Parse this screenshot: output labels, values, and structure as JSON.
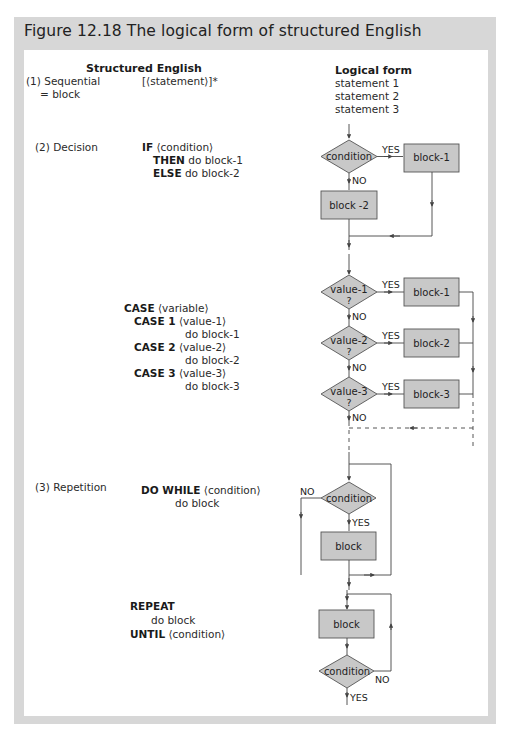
{
  "figure": {
    "title": "Figure 12.18 The logical form of structured English"
  },
  "headers": {
    "structured_english": "Structured English",
    "logical_form": "Logical form"
  },
  "sequential": {
    "label_line1": "(1) Sequential",
    "label_line2": "= block",
    "syntax": "[⟨statement⟩]*",
    "logical_form": [
      "statement 1",
      "statement 2",
      "statement 3"
    ]
  },
  "decision": {
    "label": "(2) Decision",
    "if_keyword": "IF",
    "if_rest": "⟨condition⟩",
    "then_keyword": "THEN",
    "then_rest": "do block-1",
    "else_keyword": "ELSE",
    "else_rest": "do block-2",
    "flow": {
      "diamond": "condition",
      "yes": "YES",
      "no": "NO",
      "block_yes": "block-1",
      "block_no": "block -2"
    }
  },
  "case": {
    "case_keyword": "CASE",
    "case_rest": "⟨variable⟩",
    "items": [
      {
        "keyword": "CASE 1",
        "value": "⟨value-1⟩",
        "action": "do block-1"
      },
      {
        "keyword": "CASE 2",
        "value": "⟨value-2⟩",
        "action": "do block-2"
      },
      {
        "keyword": "CASE 3",
        "value": "⟨value-3⟩",
        "action": "do block-3"
      }
    ],
    "flow": {
      "diamonds": [
        "value-1",
        "value-2",
        "value-3"
      ],
      "question_mark": "?",
      "blocks": [
        "block-1",
        "block-2",
        "block-3"
      ],
      "yes": "YES",
      "no": "NO"
    }
  },
  "repetition": {
    "label": "(3) Repetition",
    "do_while_keyword": "DO WHILE",
    "do_while_rest": "⟨condition⟩",
    "do_while_body": "do block",
    "do_while_flow": {
      "diamond": "condition",
      "yes": "YES",
      "no": "NO",
      "block": "block"
    },
    "repeat_keyword": "REPEAT",
    "repeat_body": "do block",
    "until_keyword": "UNTIL",
    "until_rest": "⟨condition⟩",
    "repeat_flow": {
      "block": "block",
      "diamond": "condition",
      "no": "NO",
      "yes": "YES"
    }
  },
  "colors": {
    "frame": "#d7d7d7",
    "shape_fill": "#c8c8c8",
    "shape_stroke": "#555555",
    "line": "#444444"
  }
}
